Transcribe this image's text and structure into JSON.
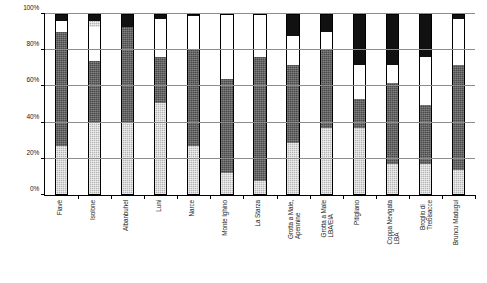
{
  "chart_data": {
    "type": "bar",
    "subtype": "stacked-percentage",
    "title": "",
    "subtitle": "",
    "xlabel": "",
    "ylabel": "",
    "ylim": [
      0,
      100
    ],
    "yticks": [
      "0%",
      "20%",
      "40%",
      "60%",
      "80%",
      "100%"
    ],
    "ytick_values": [
      0,
      20,
      40,
      60,
      80,
      100
    ],
    "grid": true,
    "legend": "none",
    "categories": [
      "Fiavè",
      "Isolone",
      "Albanbuhel",
      "Luni",
      "Narce",
      "Monte Ighino",
      "La Starza",
      "Grotta a Male,\nApennine",
      "Grotta a Male\nLBA/EIA",
      "Pitigliano",
      "Coppa Nevigata\nLBA",
      "Broglio di\nTrebisacce",
      "Bruncu Madugui"
    ],
    "series": [
      {
        "name": "light-gray-stipple",
        "fill": "fill-lightgray",
        "color": "#b4b4b4",
        "values": [
          27,
          40,
          40,
          51,
          27,
          12,
          8,
          29,
          37,
          37,
          17,
          17,
          14
        ]
      },
      {
        "name": "dark-gray-stipple",
        "fill": "fill-darkgray",
        "color": "#4a4a4a",
        "values": [
          63,
          34,
          53,
          25,
          53,
          52,
          68,
          43,
          43,
          16,
          45,
          33,
          58
        ]
      },
      {
        "name": "white",
        "fill": "fill-white",
        "color": "#ffffff",
        "values": [
          6,
          19,
          0,
          21,
          19,
          36,
          24,
          16,
          10,
          19,
          10,
          26,
          25
        ]
      },
      {
        "name": "light-gray-cap",
        "fill": "fill-lightgray",
        "color": "#b4b4b4",
        "values": [
          0,
          3,
          0,
          0,
          0,
          0,
          0,
          0,
          0,
          0,
          0,
          0,
          0
        ]
      },
      {
        "name": "black",
        "fill": "fill-black",
        "color": "#111111",
        "values": [
          4,
          4,
          7,
          3,
          1,
          0,
          0,
          12,
          10,
          28,
          28,
          24,
          3
        ]
      }
    ]
  }
}
